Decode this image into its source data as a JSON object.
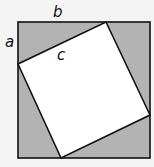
{
  "diagram": {
    "labels": {
      "a": "a",
      "b": "b",
      "c": "c"
    },
    "colors": {
      "background": "#f4f4f4",
      "outer_fill": "#b3b3b3",
      "inner_fill": "#ffffff",
      "stroke": "#111111"
    },
    "outer_square": {
      "x": 18,
      "y": 22,
      "size": 132
    },
    "inner_square_points": "106,22 150,115 61,158 18,64"
  }
}
